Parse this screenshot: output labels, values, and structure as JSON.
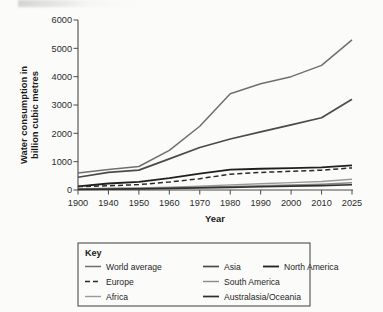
{
  "figure": {
    "background_color": "#fbfbfa",
    "ink_color": "#2b2b2b"
  },
  "axes": {
    "x_title": "Year",
    "y_title_line1": "Water consumption in",
    "y_title_line2": "billion cubic metres"
  },
  "legend": {
    "title": "Key",
    "entries": [
      {
        "label": "World average",
        "color": "#6f6f6f",
        "width": 1.5,
        "dash": "none",
        "column": 0,
        "row": 0
      },
      {
        "label": "Europe",
        "color": "#2a2a2a",
        "width": 1.5,
        "dash": "5,3",
        "column": 0,
        "row": 1
      },
      {
        "label": "Africa",
        "color": "#9a9a9a",
        "width": 1.4,
        "dash": "none",
        "column": 0,
        "row": 2
      },
      {
        "label": "Asia",
        "color": "#4a4a4a",
        "width": 1.7,
        "dash": "none",
        "column": 1,
        "row": 0
      },
      {
        "label": "South America",
        "color": "#8a8a8a",
        "width": 1.4,
        "dash": "none",
        "column": 1,
        "row": 1
      },
      {
        "label": "Australasia/Oceania",
        "color": "#303030",
        "width": 1.7,
        "dash": "none",
        "column": 1,
        "row": 2
      },
      {
        "label": "North America",
        "color": "#1f1f1f",
        "width": 1.8,
        "dash": "none",
        "column": 2,
        "row": 0
      }
    ]
  },
  "chart_data": {
    "type": "line",
    "title": "",
    "xlabel": "Year",
    "ylabel": "Water consumption in billion cubic metres",
    "categories": [
      "1900",
      "1940",
      "1950",
      "1960",
      "1970",
      "1980",
      "1990",
      "2000",
      "2010",
      "2025"
    ],
    "ylim": [
      0,
      6000
    ],
    "yticks": [
      0,
      1000,
      2000,
      3000,
      4000,
      5000,
      6000
    ],
    "grid": false,
    "legend_position": "below-plot",
    "series": [
      {
        "name": "World average",
        "color": "#6f6f6f",
        "dash": "none",
        "width": 1.5,
        "values": [
          600,
          720,
          830,
          1400,
          2250,
          3400,
          3750,
          4000,
          4400,
          5300
        ]
      },
      {
        "name": "Asia",
        "color": "#4a4a4a",
        "dash": "none",
        "width": 1.7,
        "values": [
          450,
          620,
          700,
          1100,
          1500,
          1800,
          2050,
          2300,
          2550,
          3200
        ]
      },
      {
        "name": "North America",
        "color": "#1f1f1f",
        "dash": "none",
        "width": 1.8,
        "values": [
          130,
          230,
          290,
          420,
          580,
          720,
          750,
          770,
          800,
          870
        ]
      },
      {
        "name": "Europe",
        "color": "#2a2a2a",
        "dash": "5,3",
        "width": 1.5,
        "values": [
          120,
          150,
          190,
          280,
          400,
          560,
          620,
          660,
          700,
          780
        ]
      },
      {
        "name": "Africa",
        "color": "#9a9a9a",
        "dash": "none",
        "width": 1.4,
        "values": [
          40,
          60,
          75,
          95,
          130,
          180,
          220,
          260,
          300,
          380
        ]
      },
      {
        "name": "South America",
        "color": "#8a8a8a",
        "dash": "none",
        "width": 1.4,
        "values": [
          30,
          45,
          55,
          70,
          95,
          125,
          150,
          175,
          205,
          255
        ]
      },
      {
        "name": "Australasia/Oceania",
        "color": "#303030",
        "dash": "none",
        "width": 1.7,
        "values": [
          20,
          30,
          40,
          55,
          75,
          95,
          115,
          135,
          155,
          185
        ]
      }
    ]
  }
}
